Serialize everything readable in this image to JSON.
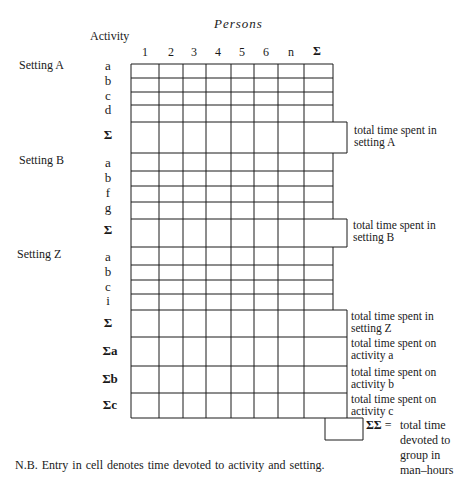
{
  "header": {
    "title": "Persons",
    "activity_label": "Activity",
    "columns": [
      "1",
      "2",
      "3",
      "4",
      "5",
      "6",
      "n",
      "Σ"
    ]
  },
  "settings": [
    {
      "label": "Setting A",
      "activities": [
        "a",
        "b",
        "c",
        "d"
      ],
      "sum_label": "Σ",
      "annotation_line1": "total time spent in",
      "annotation_line2": "setting A"
    },
    {
      "label": "Setting B",
      "activities": [
        "a",
        "b",
        "f",
        "g"
      ],
      "sum_label": "Σ",
      "annotation_line1": "total time spent in",
      "annotation_line2": "setting B"
    },
    {
      "label": "Setting Z",
      "activities": [
        "a",
        "b",
        "c",
        "i"
      ],
      "sum_label": "Σ",
      "annotation_line1": "total time spent in",
      "annotation_line2": "setting Z"
    }
  ],
  "activity_totals": [
    {
      "label": "Σa",
      "annotation_line1": "total time spent on",
      "annotation_line2": "activity  a"
    },
    {
      "label": "Σb",
      "annotation_line1": "total time spent on",
      "annotation_line2": "activity b"
    },
    {
      "label": "Σc",
      "annotation_line1": "total time spent on",
      "annotation_line2": "activity c"
    }
  ],
  "grand_total": {
    "label": "ΣΣ",
    "equals": "=",
    "lines": [
      "total time",
      "devoted to",
      "group in",
      "man–hours"
    ]
  },
  "footnote": "N.B. Entry in cell denotes time devoted to activity and setting."
}
